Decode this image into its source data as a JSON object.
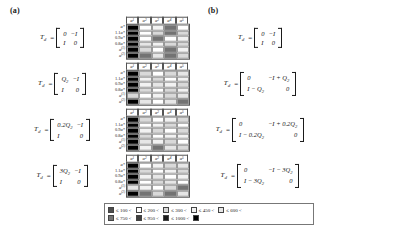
{
  "figure": {
    "panels": [
      {
        "label": "(a)",
        "rows": [
          {
            "formula": {
              "lhs": "T",
              "lhs_sub": "d",
              "eq": "=",
              "m11": "0",
              "m12": "−I",
              "m21": "I",
              "m22": "0"
            },
            "heatmap": {
              "col_headers": [
                "α₁",
                "α₂",
                "α₃",
                "α₄",
                "α₅"
              ],
              "row_labels": [
                "α*",
                "1.1α*",
                "0.9α*",
                "0.8α*",
                "α⁽¹⁾",
                "α⁽²⁾"
              ],
              "values": [
                [
                  1000,
                  200,
                  450,
                  750,
                  200
                ],
                [
                  1000,
                  200,
                  300,
                  750,
                  300
                ],
                [
                  1000,
                  200,
                  750,
                  200,
                  450
                ],
                [
                  1000,
                  600,
                  450,
                  300,
                  300
                ],
                [
                  1000,
                  300,
                  200,
                  750,
                  450
                ],
                [
                  1000,
                  750,
                  600,
                  750,
                  300
                ]
              ]
            }
          },
          {
            "formula": {
              "lhs": "T",
              "lhs_sub": "d",
              "eq": "=",
              "m11": "Q₂",
              "m12": "−I",
              "m21": "I",
              "m22": "0"
            },
            "heatmap": {
              "col_headers": [
                "α₁",
                "α₂",
                "α₃",
                "α₄",
                "α₅"
              ],
              "row_labels": [
                "α*",
                "1.1α*",
                "0.9α*",
                "0.8α*",
                "α⁽¹⁾",
                "α⁽²⁾"
              ],
              "values": [
                [
                  1000,
                  300,
                  200,
                  300,
                  600
                ],
                [
                  1000,
                  450,
                  300,
                  200,
                  450
                ],
                [
                  1000,
                  450,
                  600,
                  450,
                  300
                ],
                [
                  1000,
                  300,
                  200,
                  300,
                  450
                ],
                [
                  300,
                  200,
                  450,
                  300,
                  600
                ],
                [
                  1000,
                  600,
                  200,
                  600,
                  750
                ]
              ]
            }
          },
          {
            "formula": {
              "lhs": "T",
              "lhs_sub": "d",
              "eq": "=",
              "m11": "0.2Q₂",
              "m12": "−I",
              "m21": "I",
              "m22": "0"
            },
            "heatmap": {
              "col_headers": [
                "α₁",
                "α₂",
                "α₃",
                "α₄",
                "α₅"
              ],
              "row_labels": [
                "α*",
                "1.1α*",
                "0.9α*",
                "0.8α*",
                "α⁽¹⁾",
                "α⁽²⁾"
              ],
              "values": [
                [
                  1000,
                  300,
                  200,
                  450,
                  300
                ],
                [
                  1000,
                  200,
                  450,
                  300,
                  200
                ],
                [
                  1000,
                  450,
                  300,
                  200,
                  300
                ],
                [
                  1000,
                  300,
                  200,
                  450,
                  450
                ],
                [
                  1000,
                  600,
                  450,
                  300,
                  200
                ],
                [
                  1000,
                  450,
                  750,
                  600,
                  300
                ]
              ]
            }
          },
          {
            "formula": {
              "lhs": "T",
              "lhs_sub": "d",
              "eq": "=",
              "m11": "3Q₂",
              "m12": "−I",
              "m21": "I",
              "m22": "0"
            },
            "heatmap": {
              "col_headers": [
                "α₁",
                "α₂",
                "α₃",
                "α₄",
                "α₅"
              ],
              "row_labels": [
                "α*",
                "1.1α*",
                "0.9α*",
                "0.8α*",
                "α⁽¹⁾",
                "α⁽²⁾"
              ],
              "values": [
                [
                  1000,
                  200,
                  450,
                  300,
                  600
                ],
                [
                  1000,
                  300,
                  200,
                  450,
                  300
                ],
                [
                  1000,
                  450,
                  600,
                  200,
                  450
                ],
                [
                  1000,
                  200,
                  300,
                  600,
                  200
                ],
                [
                  600,
                  450,
                  200,
                  300,
                  750
                ],
                [
                  1000,
                  750,
                  300,
                  750,
                  600
                ]
              ]
            }
          }
        ]
      },
      {
        "label": "(b)",
        "rows": [
          {
            "formula": {
              "lhs": "T",
              "lhs_sub": "d",
              "eq": "=",
              "m11": "0",
              "m12": "−I",
              "m21": "I",
              "m22": "0"
            },
            "heatmap": {
              "col_headers": [
                "α₁",
                "α₂",
                "α₃",
                "α₄",
                "α₅"
              ],
              "row_labels": [
                "α*",
                "1.1α*",
                "0.9α*",
                "0.8α*",
                "α⁽¹⁾",
                "α⁽²⁾"
              ],
              "values": [
                [
                  750,
                  450,
                  600,
                  450,
                  600
                ],
                [
                  750,
                  300,
                  450,
                  750,
                  300
                ],
                [
                  600,
                  200,
                  300,
                  450,
                  600
                ],
                [
                  750,
                  450,
                  300,
                  600,
                  450
                ],
                [
                  600,
                  450,
                  600,
                  450,
                  300
                ],
                [
                  750,
                  600,
                  450,
                  600,
                  750
                ]
              ]
            }
          },
          {
            "formula": {
              "lhs": "T",
              "lhs_sub": "d",
              "eq": "=",
              "m11": "0",
              "m12": "−I + Q₂",
              "m21": "I − Q₂",
              "m22": "0"
            },
            "heatmap": {
              "col_headers": [
                "α₁",
                "α₂",
                "α₃",
                "α₄",
                "α₅"
              ],
              "row_labels": [
                "α*",
                "1.1α*",
                "0.9α*",
                "0.8α*",
                "α⁽¹⁾",
                "α⁽²⁾"
              ],
              "values": [
                [
                  950,
                  750,
                  300,
                  450,
                  750
                ],
                [
                  1000,
                  750,
                  200,
                  300,
                  950
                ],
                [
                  600,
                  200,
                  450,
                  300,
                  600
                ],
                [
                  300,
                  450,
                  200,
                  600,
                  300
                ],
                [
                  450,
                  300,
                  600,
                  450,
                  200
                ],
                [
                  750,
                  950,
                  300,
                  450,
                  750
                ]
              ]
            }
          },
          {
            "formula": {
              "lhs": "T",
              "lhs_sub": "d",
              "eq": "=",
              "m11": "0",
              "m12": "−I + 0.2Q₂",
              "m21": "I − 0.2Q₂",
              "m22": "0"
            },
            "heatmap": {
              "col_headers": [
                "α₁",
                "α₂",
                "α₃",
                "α₄",
                "α₅"
              ],
              "row_labels": [
                "α*",
                "1.1α*",
                "0.9α*",
                "0.8α*",
                "α⁽¹⁾",
                "α⁽²⁾"
              ],
              "values": [
                [
                  600,
                  450,
                  300,
                  600,
                  450
                ],
                [
                  750,
                  300,
                  450,
                  200,
                  600
                ],
                [
                  450,
                  600,
                  200,
                  450,
                  300
                ],
                [
                  600,
                  300,
                  450,
                  600,
                  450
                ],
                [
                  300,
                  450,
                  600,
                  300,
                  600
                ],
                [
                  750,
                  600,
                  450,
                  750,
                  600
                ]
              ]
            }
          },
          {
            "formula": {
              "lhs": "T",
              "lhs_sub": "d",
              "eq": "=",
              "m11": "0",
              "m12": "−I − 3Q₂",
              "m21": "I − 3Q₂",
              "m22": "0"
            },
            "heatmap": {
              "col_headers": [
                "α₁",
                "α₂",
                "α₃",
                "α₄",
                "α₅"
              ],
              "row_labels": [
                "α*",
                "1.1α*",
                "0.9α*",
                "0.8α*",
                "α⁽¹⁾",
                "α⁽²⁾"
              ],
              "values": [
                [
                  200,
                  300,
                  450,
                  300,
                  200
                ],
                [
                  1000,
                  1000,
                  1000,
                  1000,
                  1000
                ],
                [
                  300,
                  450,
                  600,
                  200,
                  300
                ],
                [
                  450,
                  300,
                  200,
                  450,
                  600
                ],
                [
                  300,
                  600,
                  450,
                  300,
                  450
                ],
                [
                  600,
                  450,
                  750,
                  600,
                  300
                ]
              ]
            }
          }
        ]
      }
    ],
    "legend": {
      "line1": [
        {
          "color": "#4d4d4d",
          "text": "≤ 100 <"
        },
        {
          "color": "#ffffff",
          "text": "≤ 200 <"
        },
        {
          "color": "#d9d9d9",
          "text": "≤ 300 <"
        },
        {
          "color": "#f2f2f2",
          "text": "≤ 450 <"
        },
        {
          "color": "#e6e6e6",
          "text": "≤ 600 <"
        }
      ],
      "line2": [
        {
          "color": "#737373",
          "text": "≤ 750 <"
        },
        {
          "color": "#404040",
          "text": "≤ 950 <"
        },
        {
          "color": "#1a1a1a",
          "text": "≤ 1000 <"
        },
        {
          "color": "#000000",
          "text": ""
        }
      ]
    },
    "colors": {
      "v100": "#4d4d4d",
      "v200": "#ffffff",
      "v300": "#d9d9d9",
      "v450": "#f2f2f2",
      "v600": "#e6e6e6",
      "v750": "#737373",
      "v950": "#404040",
      "v1000": "#000000"
    }
  }
}
